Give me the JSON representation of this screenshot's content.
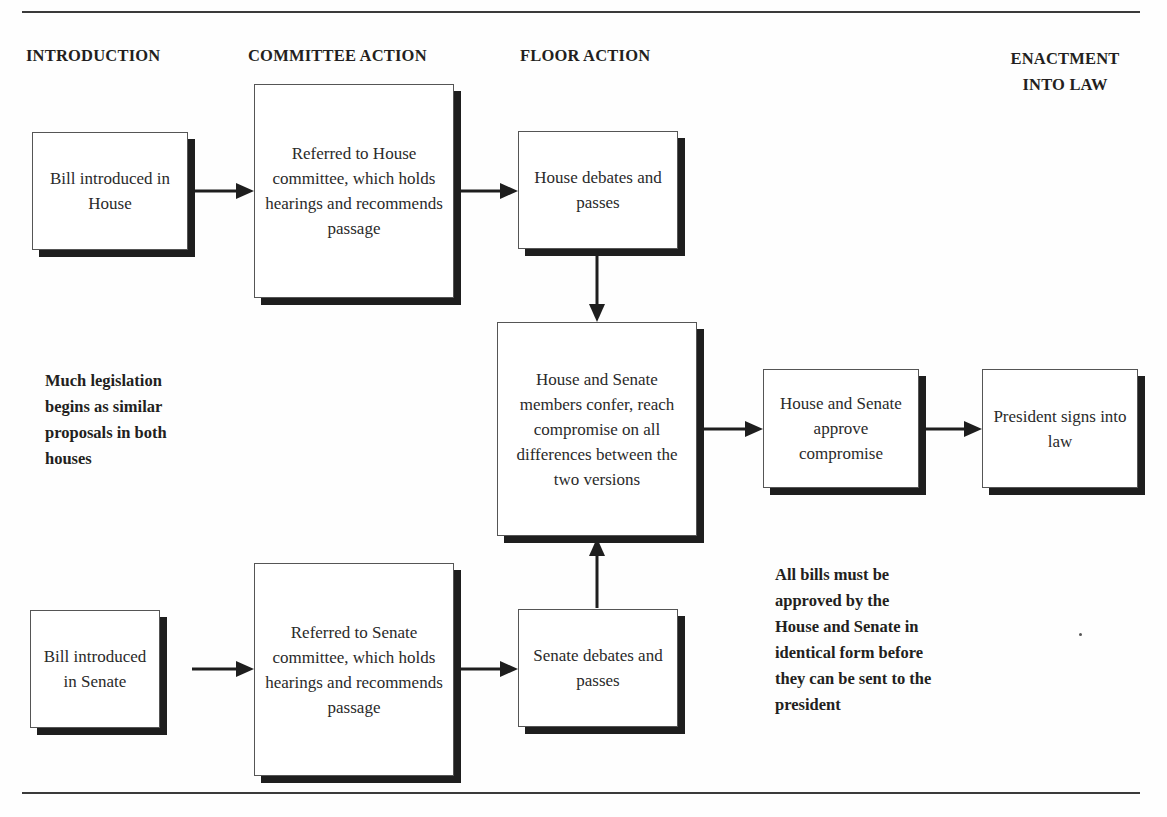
{
  "headers": {
    "introduction": "INTRODUCTION",
    "committee": "COMMITTEE ACTION",
    "floor": "FLOOR ACTION",
    "enactment_line1": "ENACTMENT",
    "enactment_line2": "INTO LAW"
  },
  "boxes": {
    "house_intro": "Bill introduced in House",
    "house_committee": "Referred to House committee, which holds hearings and recommends passage",
    "house_floor": "House debates and passes",
    "conference": "House and Senate members confer, reach compromise on all differences between the two versions",
    "approve": "House and Senate approve compromise",
    "president": "President signs into law",
    "senate_intro": "Bill introduced in Senate",
    "senate_committee": "Referred to Senate committee, which holds hearings and recommends passage",
    "senate_floor": "Senate debates and passes"
  },
  "notes": {
    "similar_proposals": "Much legislation begins as similar proposals in both houses",
    "identical_form": "All bills must be approved by the House and Senate in identical form before they can be sent to the president"
  },
  "colors": {
    "ink": "#231f20",
    "shadow": "#1e1e1e",
    "rule": "#3a3a3a"
  }
}
